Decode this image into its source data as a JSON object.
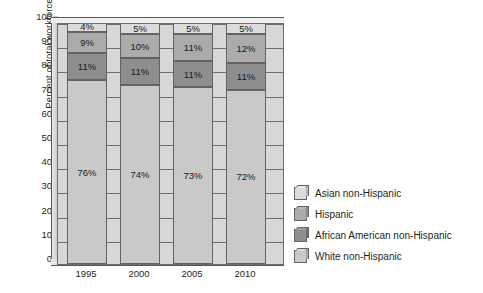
{
  "chart_data": {
    "type": "bar",
    "subtype": "stacked-bar-3d",
    "title": "",
    "xlabel": "",
    "ylabel": "Percent of total workforce",
    "categories": [
      "1995",
      "2000",
      "2005",
      "2010"
    ],
    "ylim": [
      0,
      100
    ],
    "yticks": [
      0,
      10,
      20,
      30,
      40,
      50,
      60,
      70,
      80,
      90,
      100
    ],
    "grid": true,
    "legend_position": "right",
    "stack_order_bottom_to_top": [
      "White non-Hispanic",
      "African American non-Hispanic",
      "Hispanic",
      "Asian non-Hispanic"
    ],
    "series": [
      {
        "name": "White non-Hispanic",
        "color": "#c9c9c9",
        "face_color": "#a9a9a9",
        "cap_color": "#dadada",
        "values": [
          76,
          74,
          73,
          72
        ],
        "labels": [
          "76%",
          "74%",
          "73%",
          "72%"
        ]
      },
      {
        "name": "African American non-Hispanic",
        "color": "#8e8e8e",
        "face_color": "#6e6e6e",
        "cap_color": "#a0a0a0",
        "values": [
          11,
          11,
          11,
          11
        ],
        "labels": [
          "11%",
          "11%",
          "11%",
          "11%"
        ]
      },
      {
        "name": "Hispanic",
        "color": "#ababab",
        "face_color": "#8c8c8c",
        "cap_color": "#bdbdbd",
        "values": [
          9,
          10,
          11,
          12
        ],
        "labels": [
          "9%",
          "10%",
          "11%",
          "12%"
        ]
      },
      {
        "name": "Asian non-Hispanic",
        "color": "#dcdcdc",
        "face_color": "#bcbcbc",
        "cap_color": "#e9e9e9",
        "values": [
          4,
          5,
          5,
          5
        ],
        "labels": [
          "4%",
          "5%",
          "5%",
          "5%"
        ]
      }
    ],
    "plot_background": "#d7d7d7",
    "page_background": "#ffffff"
  },
  "axes": {
    "y_title": "Percent of total workforce",
    "y_tick_labels": [
      "100",
      "90",
      "80",
      "70",
      "60",
      "50",
      "40",
      "30",
      "20",
      "10",
      "0"
    ],
    "x_tick_labels": [
      "1995",
      "2000",
      "2005",
      "2010"
    ]
  },
  "legend": {
    "items": [
      {
        "label": "Asian non-Hispanic",
        "color": "#dcdcdc",
        "face_color": "#bcbcbc",
        "cap_color": "#e9e9e9"
      },
      {
        "label": "Hispanic",
        "color": "#ababab",
        "face_color": "#8c8c8c",
        "cap_color": "#bdbdbd"
      },
      {
        "label": "African American non-Hispanic",
        "color": "#8e8e8e",
        "face_color": "#6e6e6e",
        "cap_color": "#a0a0a0"
      },
      {
        "label": "White non-Hispanic",
        "color": "#c9c9c9",
        "face_color": "#a9a9a9",
        "cap_color": "#dadada"
      }
    ]
  }
}
